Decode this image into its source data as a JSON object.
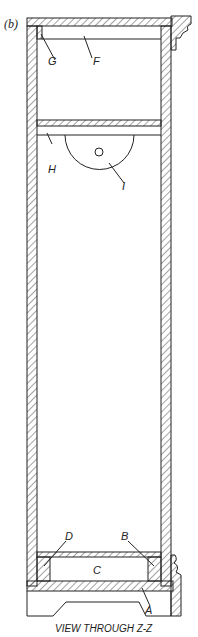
{
  "figure": {
    "panel_label": "(b)",
    "caption": "VIEW THROUGH Z-Z",
    "labels": {
      "A": "A",
      "B": "B",
      "C": "C",
      "D": "D",
      "F": "F",
      "G": "G",
      "H": "H",
      "I": "I"
    }
  },
  "colors": {
    "line": "#222222",
    "background": "#ffffff"
  }
}
